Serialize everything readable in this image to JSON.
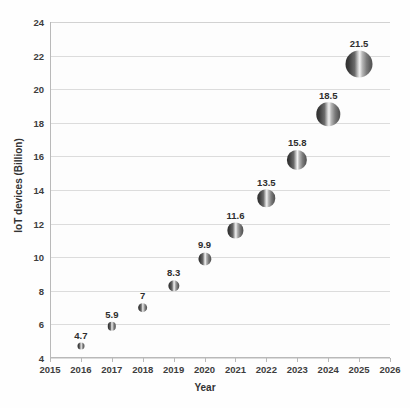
{
  "chart_data": {
    "type": "scatter",
    "title": "",
    "xlabel": "Year",
    "ylabel": "IoT devices (Billion)",
    "x": [
      2016,
      2017,
      2018,
      2019,
      2020,
      2021,
      2022,
      2023,
      2024,
      2025
    ],
    "values": [
      4.7,
      5.9,
      7,
      8.3,
      9.9,
      11.6,
      13.5,
      15.8,
      18.5,
      21.5
    ],
    "point_labels": [
      "4.7",
      "5.9",
      "7",
      "8.3",
      "9.9",
      "11.6",
      "13.5",
      "15.8",
      "18.5",
      "21.5"
    ],
    "xlim": [
      2015,
      2026
    ],
    "ylim": [
      4,
      24
    ],
    "xticks": [
      "2015",
      "2016",
      "2017",
      "2018",
      "2019",
      "2020",
      "2021",
      "2022",
      "2023",
      "2024",
      "2025",
      "2026"
    ],
    "yticks": [
      "4",
      "6",
      "8",
      "10",
      "12",
      "14",
      "16",
      "18",
      "20",
      "22",
      "24"
    ],
    "grid": "horizontal",
    "legend": "none",
    "marker_style": "gradient-sphere",
    "marker_size_scales_with_value": true,
    "colors": {
      "marker_dark": "#2f2f2f",
      "marker_highlight": "#f2f2f2",
      "gridline": "#dcdcdc",
      "axis": "#b9b9b9",
      "text": "#3d3d3d",
      "background": "#fefefe"
    }
  }
}
